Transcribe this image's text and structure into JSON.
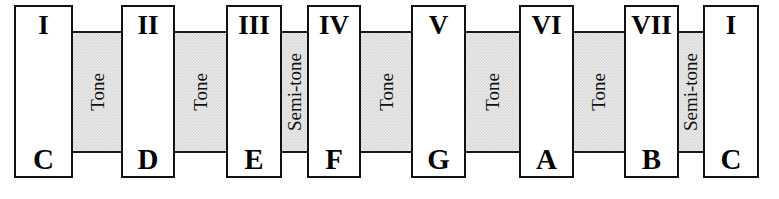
{
  "diagram": {
    "canvas": {
      "width": 779,
      "height": 199,
      "background": "#ffffff"
    },
    "colors": {
      "band_fill": "#d9d9d9",
      "outline": "#111111",
      "box_fill": "#ffffff",
      "text": "#050505"
    },
    "degrees": [
      {
        "roman": "I",
        "note": "C",
        "x": 14,
        "y": 5,
        "w": 59,
        "h": 173
      },
      {
        "roman": "II",
        "note": "D",
        "x": 121,
        "y": 5,
        "w": 54,
        "h": 173
      },
      {
        "roman": "III",
        "note": "E",
        "x": 226,
        "y": 5,
        "w": 56,
        "h": 173
      },
      {
        "roman": "IV",
        "note": "F",
        "x": 307,
        "y": 5,
        "w": 54,
        "h": 173
      },
      {
        "roman": "V",
        "note": "G",
        "x": 411,
        "y": 5,
        "w": 55,
        "h": 173
      },
      {
        "roman": "VI",
        "note": "A",
        "x": 519,
        "y": 5,
        "w": 55,
        "h": 173
      },
      {
        "roman": "VII",
        "note": "B",
        "x": 624,
        "y": 5,
        "w": 55,
        "h": 173
      },
      {
        "roman": "I",
        "note": "C",
        "x": 703,
        "y": 5,
        "w": 56,
        "h": 173
      }
    ],
    "intervals": [
      {
        "label": "Tone",
        "kind": "tone",
        "x": 71,
        "y": 31,
        "w": 54,
        "h": 122
      },
      {
        "label": "Tone",
        "kind": "tone",
        "x": 173,
        "y": 31,
        "w": 56,
        "h": 122
      },
      {
        "label": "Semi-tone",
        "kind": "semi-tone",
        "x": 280,
        "y": 31,
        "w": 29,
        "h": 122
      },
      {
        "label": "Tone",
        "kind": "tone",
        "x": 359,
        "y": 31,
        "w": 55,
        "h": 122
      },
      {
        "label": "Tone",
        "kind": "tone",
        "x": 464,
        "y": 31,
        "w": 57,
        "h": 122
      },
      {
        "label": "Tone",
        "kind": "tone",
        "x": 572,
        "y": 31,
        "w": 54,
        "h": 122
      },
      {
        "label": "Semi-tone",
        "kind": "semi-tone",
        "x": 677,
        "y": 31,
        "w": 28,
        "h": 122
      }
    ]
  }
}
